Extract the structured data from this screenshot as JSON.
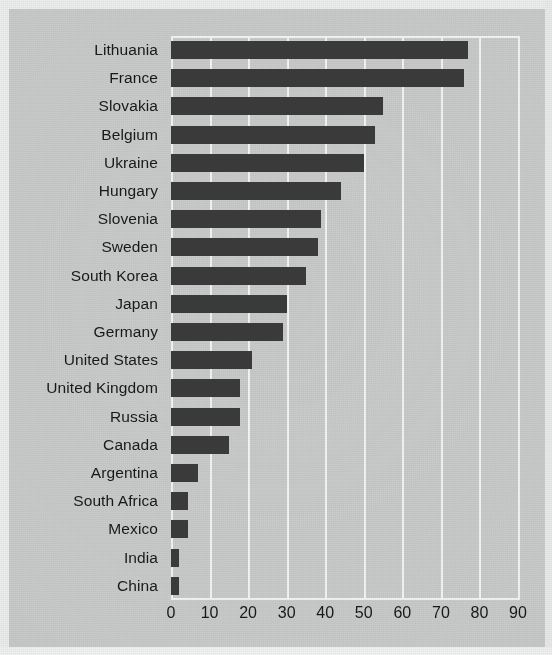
{
  "figure": {
    "background_color": "#c9caca",
    "bar_color": "#3b3b3b",
    "grid_color": "#f3f4f4",
    "text_color": "#19191a",
    "caption_sliver": ""
  },
  "chart_data": {
    "type": "bar",
    "orientation": "horizontal",
    "title": "",
    "subtitle": "",
    "xlabel": "",
    "ylabel": "",
    "xlim": [
      0,
      90
    ],
    "ylim": null,
    "grid": true,
    "grid_axis": "x",
    "legend": false,
    "legend_position": "none",
    "xticks": [
      0,
      10,
      20,
      30,
      40,
      50,
      60,
      70,
      80,
      90
    ],
    "xtick_labels": [
      "0",
      "10",
      "20",
      "30",
      "40",
      "50",
      "60",
      "70",
      "80",
      "90"
    ],
    "categories": [
      "Lithuania",
      "France",
      "Slovakia",
      "Belgium",
      "Ukraine",
      "Hungary",
      "Slovenia",
      "Sweden",
      "South Korea",
      "Japan",
      "Germany",
      "United States",
      "United Kingdom",
      "Russia",
      "Canada",
      "Argentina",
      "South Africa",
      "Mexico",
      "India",
      "China"
    ],
    "values": [
      77,
      76,
      55,
      53,
      50,
      44,
      39,
      38,
      35,
      30,
      29,
      21,
      18,
      18,
      15,
      7,
      4.5,
      4.5,
      2,
      2
    ]
  }
}
